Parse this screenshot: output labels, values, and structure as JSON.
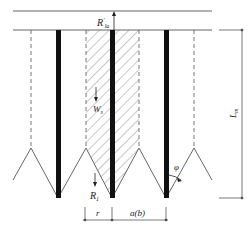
{
  "labels": {
    "top_reaction": "R",
    "top_reaction_prime": "′",
    "top_reaction_sub": "la",
    "soil_weight": "W",
    "soil_weight_sub": "s",
    "pile_reaction": "R",
    "pile_reaction_sub": "1",
    "length": "L",
    "length_sub": "m",
    "angle": "φ",
    "radius": "r",
    "spacing": "a(b)"
  },
  "colors": {
    "line": "#555555",
    "pile": "#111111",
    "hatch": "#666666"
  }
}
